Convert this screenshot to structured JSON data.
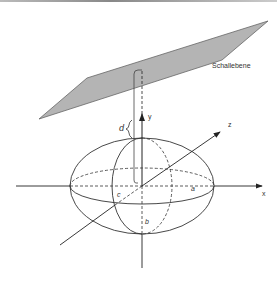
{
  "diagram": {
    "plane_label": "Schallebene",
    "axes": {
      "x": "x",
      "y": "y",
      "z": "z"
    },
    "semi_axes": {
      "a": "a",
      "b": "b",
      "c": "c"
    },
    "distance_label": "d",
    "colors": {
      "plane_fill": "#b4b4b4",
      "plane_stroke": "#666666",
      "line": "#333333"
    }
  }
}
